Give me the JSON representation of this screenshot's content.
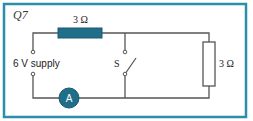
{
  "question": {
    "label": "Q7"
  },
  "colors": {
    "frame": "#2a8fa8",
    "component": "#1f6f8b",
    "wire": "#555555"
  },
  "components": {
    "top_resistor": {
      "label": "3 Ω"
    },
    "right_resistor": {
      "label": "3 Ω"
    },
    "supply": {
      "label": "6 V supply"
    },
    "switch": {
      "label": "S"
    },
    "ammeter": {
      "label": "A"
    }
  }
}
